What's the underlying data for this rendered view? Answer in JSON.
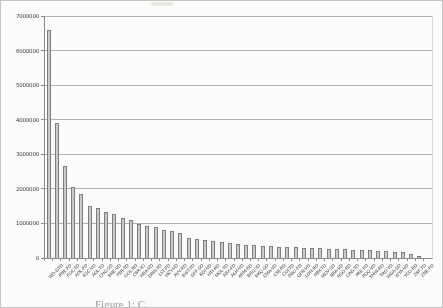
{
  "page": {
    "caption": "Figure 1: C"
  },
  "chart_data": {
    "type": "bar",
    "title": "",
    "xlabel": "",
    "ylabel": "",
    "legend": "none",
    "grid": "horizontal gridlines every 1000000",
    "ylim": [
      0,
      7000000
    ],
    "y_ticks": [
      7000000,
      6000000,
      5000000,
      4000000,
      3000000,
      2000000,
      1000000,
      0
    ],
    "categories": [
      "WD-GYD",
      "PNE-FD",
      "FOC-TD",
      "ADL-FD",
      "KSC-VD",
      "AQL-YD",
      "CHG-SD",
      "BNE-VD",
      "PER-TD",
      "OOL-RD",
      "CBR-YO",
      "HBA-VD",
      "DRW-YD",
      "LST-FD",
      "MCY-VD",
      "AVV-RD",
      "BWT-YD",
      "GFF-SD",
      "KGI-VD",
      "HTI-RD",
      "MQL-YD",
      "ABX-FD",
      "ALH-VD",
      "ARM-RD",
      "BHQ-YD",
      "BKQ-SD",
      "CMA-VD",
      "CNJ-RD",
      "COJ-YD",
      "DBO-FD",
      "GFN-VD",
      "LDH-RD",
      "MIM-YD",
      "MOV-SD",
      "NRA-VD",
      "NSO-RD",
      "OAG-YD",
      "PKE-FD",
      "PQQ-VD",
      "TMW-RD",
      "TRO-YD",
      "WGA-SD",
      "WYA-VD",
      "YCO-RD",
      "ZBF-YD",
      "ZNE-FD"
    ],
    "values": [
      6600000,
      3900000,
      2650000,
      2050000,
      1850000,
      1500000,
      1450000,
      1320000,
      1270000,
      1160000,
      1100000,
      980000,
      930000,
      900000,
      820000,
      770000,
      730000,
      590000,
      560000,
      530000,
      490000,
      460000,
      430000,
      410000,
      390000,
      370000,
      350000,
      340000,
      330000,
      320000,
      310000,
      300000,
      290000,
      280000,
      270000,
      260000,
      250000,
      240000,
      230000,
      220000,
      210000,
      200000,
      180000,
      160000,
      110000,
      50000
    ],
    "colors": {
      "bar_fill": "#cacaca",
      "bar_border": "#7d7d7d",
      "grid": "#b2b2b2",
      "axis": "#8a8a8a",
      "tick_text": "#3c3c3c",
      "background": "#fcfbf9",
      "page_border": "#c3c3c3",
      "caption_text": "#9a9a9a"
    }
  }
}
